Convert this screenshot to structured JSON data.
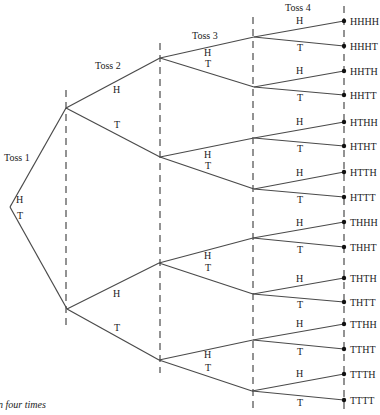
{
  "diagram": {
    "caption": "n four times",
    "toss_labels": [
      "Toss 1",
      "Toss 2",
      "Toss 3",
      "Toss 4"
    ],
    "branch_labels": {
      "heads": "H",
      "tails": "T"
    },
    "outcomes": [
      "HHHH",
      "HHHT",
      "HHTH",
      "HHTT",
      "HTHH",
      "HTHT",
      "HTTH",
      "HTTT",
      "THHH",
      "THHT",
      "THTH",
      "THTT",
      "TTHH",
      "TTHT",
      "TTTH",
      "TTTT"
    ],
    "colors": {
      "line": "#4a4a4a",
      "text": "#222222",
      "dot": "#111111",
      "background": "#ffffff"
    }
  }
}
